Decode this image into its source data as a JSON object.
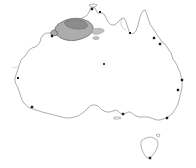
{
  "map": {
    "title": "Australia",
    "subject": "species distribution map",
    "background_color": "#ffffff",
    "coastline_color": "#6b6b6b",
    "latitude_line_color": "#d9d9d6",
    "latitude_line_label": "Tropic of Capricorn",
    "range_fill_color": "#a8a8a8",
    "range_outline_color": "#5a5a5a",
    "marker_color": "#1a1a1a",
    "legend_visible": "false",
    "axis_visible": "false",
    "scalebar_visible": "false"
  },
  "distribution": {
    "region_name": "Kimberley / Top End",
    "shaded_areas": [
      {
        "name": "main-range-kimberley",
        "fill": "#a8a8a8"
      },
      {
        "name": "range-extension-arnhem",
        "fill": "#b9b9b9"
      },
      {
        "name": "range-core-dark",
        "fill": "#8a8a8a"
      }
    ]
  },
  "markers": [
    {
      "name": "marker-broome",
      "x": 52,
      "y": 36
    },
    {
      "name": "marker-darwin",
      "x": 92,
      "y": 9
    },
    {
      "name": "marker-arnhem-coast",
      "x": 100,
      "y": 12
    },
    {
      "name": "marker-gulf-coast",
      "x": 130,
      "y": 33
    },
    {
      "name": "marker-cairns",
      "x": 154,
      "y": 38
    },
    {
      "name": "marker-townsville",
      "x": 160,
      "y": 44
    },
    {
      "name": "marker-brisbane",
      "x": 182,
      "y": 80
    },
    {
      "name": "marker-sydney",
      "x": 178,
      "y": 90
    },
    {
      "name": "marker-alice-springs",
      "x": 104,
      "y": 64
    },
    {
      "name": "marker-perth",
      "x": 32,
      "y": 107
    },
    {
      "name": "marker-carnarvon",
      "x": 18,
      "y": 78
    },
    {
      "name": "marker-adelaide",
      "x": 123,
      "y": 114
    },
    {
      "name": "marker-melbourne",
      "x": 167,
      "y": 118
    },
    {
      "name": "marker-hobart",
      "x": 150,
      "y": 158
    }
  ],
  "islands": [
    {
      "name": "tasmania"
    },
    {
      "name": "kangaroo-island"
    },
    {
      "name": "melville-island"
    }
  ]
}
